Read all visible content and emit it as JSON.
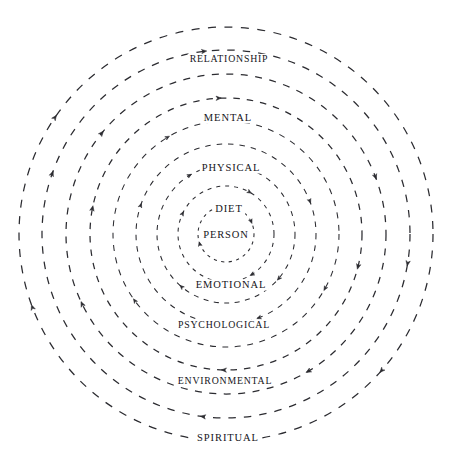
{
  "diagram": {
    "type": "concentric-rings",
    "title": "",
    "center": {
      "x": 226,
      "y": 234
    },
    "stroke_color": "#2b2b30",
    "background_color": "#ffffff",
    "flow_direction": "clockwise",
    "ring_count": 9,
    "rings": [
      {
        "index": 0,
        "label": "PERSON",
        "radius": 28,
        "label_position": "center",
        "label_x": 226,
        "label_y": 235,
        "dash": "3.2 4.4",
        "arrow_angles": [
          22,
          196
        ]
      },
      {
        "index": 1,
        "label": "DIET",
        "radius": 48,
        "label_position": "top",
        "label_x": 229,
        "label_y": 209,
        "dash": "4 5",
        "arrow_angles": [
          152,
          300,
          58
        ]
      },
      {
        "index": 2,
        "label": "EMOTIONAL",
        "radius": 69,
        "label_position": "bottom",
        "label_x": 231,
        "label_y": 285,
        "dash": "5 5.5",
        "arrow_angles": [
          318,
          120,
          228
        ]
      },
      {
        "index": 3,
        "label": "PHYSICAL",
        "radius": 90,
        "label_position": "top",
        "label_x": 231,
        "label_y": 168,
        "dash": "5.5 6",
        "arrow_angles": [
          160,
          20,
          290
        ]
      },
      {
        "index": 4,
        "label": "PSYCHOLOGICAL",
        "radius": 113,
        "label_position": "bottom",
        "label_x": 224,
        "label_y": 325,
        "dash": "6 6.5",
        "arrow_angles": [
          330,
          120,
          215
        ]
      },
      {
        "index": 5,
        "label": "MENTAL",
        "radius": 136,
        "label_position": "top",
        "label_x": 228,
        "label_y": 118,
        "dash": "6.5 7",
        "arrow_angles": [
          92,
          168,
          345,
          268
        ]
      },
      {
        "index": 6,
        "label": "ENVIRONMENTAL",
        "radius": 160,
        "label_position": "bottom",
        "label_x": 225,
        "label_y": 381,
        "dash": "7 7.5",
        "arrow_angles": [
          300,
          140,
          205,
          20
        ]
      },
      {
        "index": 7,
        "label": "RELATIONSHIP",
        "radius": 184,
        "label_position": "top",
        "label_x": 229,
        "label_y": 59,
        "dash": "7.5 8",
        "arrow_angles": [
          96,
          160,
          350,
          262
        ]
      },
      {
        "index": 8,
        "label": "SPIRITUAL",
        "radius": 207,
        "label_position": "bottom",
        "label_x": 228,
        "label_y": 438,
        "dash": "8 8.5",
        "arrow_angles": [
          272,
          318,
          145,
          200
        ]
      }
    ]
  }
}
